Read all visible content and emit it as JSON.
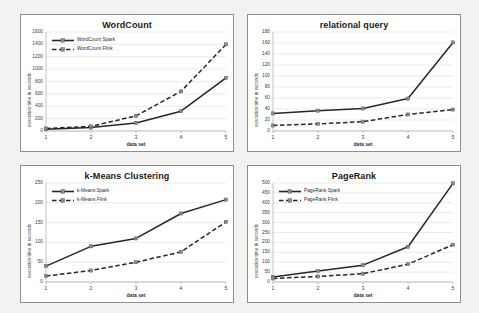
{
  "page": {
    "background_color": "#f2f2f1",
    "panel_background": "#ffffff",
    "series_colors": {
      "spark": "#262626",
      "flink": "#262626"
    }
  },
  "charts": [
    {
      "id": "wordcount",
      "title": "WordCount",
      "type": "line",
      "xlabel": "data set",
      "ylabel": "execution time in seconds",
      "categories": [
        "1",
        "2",
        "3",
        "4",
        "5"
      ],
      "xticks": [
        "1",
        "2",
        "3",
        "4",
        "5"
      ],
      "yticks": [
        "0",
        "200",
        "400",
        "600",
        "800",
        "1000",
        "1200",
        "1400",
        "1600"
      ],
      "ylim": [
        0,
        1600
      ],
      "grid": true,
      "legend_position": "upper-left",
      "has_legend": true,
      "series": [
        {
          "name": "WordCount Spark",
          "style": "solid",
          "values": [
            30,
            55,
            130,
            320,
            860
          ]
        },
        {
          "name": "WordCount Flink",
          "style": "dashed",
          "values": [
            40,
            75,
            245,
            640,
            1400
          ]
        }
      ]
    },
    {
      "id": "relational-query",
      "title": "relational query",
      "type": "line",
      "xlabel": "data set",
      "ylabel": "execution time in seconds",
      "categories": [
        "1",
        "2",
        "3",
        "4",
        "5"
      ],
      "xticks": [
        "1",
        "2",
        "3",
        "4",
        "5"
      ],
      "yticks": [
        "0",
        "20",
        "40",
        "60",
        "80",
        "100",
        "120",
        "140",
        "160",
        "180"
      ],
      "ylim": [
        0,
        180
      ],
      "grid": true,
      "legend_position": "none",
      "has_legend": false,
      "series": [
        {
          "name": "relational query Spark",
          "style": "solid",
          "values": [
            32,
            37,
            41,
            59,
            161
          ]
        },
        {
          "name": "relational query Flink",
          "style": "dashed",
          "values": [
            10,
            13,
            17,
            30,
            39
          ]
        }
      ]
    },
    {
      "id": "kmeans-clustering",
      "title": "k-Means Clustering",
      "type": "line",
      "xlabel": "data set",
      "ylabel": "execution time in seconds",
      "categories": [
        "1",
        "2",
        "3",
        "4",
        "5"
      ],
      "xticks": [
        "1",
        "2",
        "3",
        "4",
        "5"
      ],
      "yticks": [
        "0",
        "50",
        "100",
        "150",
        "200",
        "250"
      ],
      "ylim": [
        0,
        250
      ],
      "grid": true,
      "legend_position": "upper-left",
      "has_legend": true,
      "series": [
        {
          "name": "k-Means Spark",
          "style": "solid",
          "values": [
            40,
            90,
            110,
            173,
            208
          ]
        },
        {
          "name": "k-Means Flink",
          "style": "dashed",
          "values": [
            15,
            29,
            50,
            76,
            152
          ]
        }
      ]
    },
    {
      "id": "pagerank",
      "title": "PageRank",
      "type": "line",
      "xlabel": "data set",
      "ylabel": "execution time in seconds",
      "categories": [
        "1",
        "2",
        "3",
        "4",
        "5"
      ],
      "xticks": [
        "1",
        "2",
        "3",
        "4",
        "5"
      ],
      "yticks": [
        "0",
        "50",
        "100",
        "150",
        "200",
        "250",
        "300",
        "350",
        "400",
        "450",
        "500"
      ],
      "ylim": [
        0,
        500
      ],
      "grid": true,
      "legend_position": "upper-left",
      "has_legend": true,
      "series": [
        {
          "name": "PageRank Spark",
          "style": "solid",
          "values": [
            25,
            55,
            85,
            178,
            498
          ]
        },
        {
          "name": "PageRank Flink",
          "style": "dashed",
          "values": [
            18,
            28,
            42,
            90,
            188
          ]
        }
      ]
    }
  ],
  "chart_data": [
    {
      "type": "line",
      "title": "WordCount",
      "xlabel": "data set",
      "ylabel": "execution time in seconds",
      "categories": [
        "1",
        "2",
        "3",
        "4",
        "5"
      ],
      "ylim": [
        0,
        1600
      ],
      "grid": true,
      "legend": [
        "WordCount Spark",
        "WordCount Flink"
      ],
      "legend_position": "upper left",
      "series": [
        {
          "name": "WordCount Spark",
          "values": [
            30,
            55,
            130,
            320,
            860
          ]
        },
        {
          "name": "WordCount Flink",
          "values": [
            40,
            75,
            245,
            640,
            1400
          ]
        }
      ]
    },
    {
      "type": "line",
      "title": "relational query",
      "xlabel": "data set",
      "ylabel": "execution time in seconds",
      "categories": [
        "1",
        "2",
        "3",
        "4",
        "5"
      ],
      "ylim": [
        0,
        180
      ],
      "grid": true,
      "legend": [],
      "legend_position": "none",
      "series": [
        {
          "name": "relational query Spark",
          "values": [
            32,
            37,
            41,
            59,
            161
          ]
        },
        {
          "name": "relational query Flink",
          "values": [
            10,
            13,
            17,
            30,
            39
          ]
        }
      ]
    },
    {
      "type": "line",
      "title": "k-Means Clustering",
      "xlabel": "data set",
      "ylabel": "execution time in seconds",
      "categories": [
        "1",
        "2",
        "3",
        "4",
        "5"
      ],
      "ylim": [
        0,
        250
      ],
      "grid": true,
      "legend": [
        "k-Means Spark",
        "k-Means Flink"
      ],
      "legend_position": "upper left",
      "series": [
        {
          "name": "k-Means Spark",
          "values": [
            40,
            90,
            110,
            173,
            208
          ]
        },
        {
          "name": "k-Means Flink",
          "values": [
            15,
            29,
            50,
            76,
            152
          ]
        }
      ]
    },
    {
      "type": "line",
      "title": "PageRank",
      "xlabel": "data set",
      "ylabel": "execution time in seconds",
      "categories": [
        "1",
        "2",
        "3",
        "4",
        "5"
      ],
      "ylim": [
        0,
        500
      ],
      "grid": true,
      "legend": [
        "PageRank Spark",
        "PageRank Flink"
      ],
      "legend_position": "upper left",
      "series": [
        {
          "name": "PageRank Spark",
          "values": [
            25,
            55,
            85,
            178,
            498
          ]
        },
        {
          "name": "PageRank Flink",
          "values": [
            18,
            28,
            42,
            90,
            188
          ]
        }
      ]
    }
  ]
}
